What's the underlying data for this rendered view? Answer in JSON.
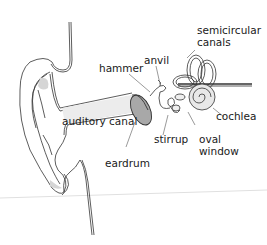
{
  "diagram": {
    "title": "",
    "labels": {
      "semicircular_canals": "semicircular\ncanals",
      "anvil": "anvil",
      "hammer": "hammer",
      "cochlea": "cochlea",
      "auditory_canal": "auditory canal",
      "stirrup": "stirrup",
      "oval_window": "oval\nwindow",
      "eardrum": "eardrum"
    },
    "colors": {
      "line": "#333333",
      "fill_gray": "#d9d9d9",
      "eardrum_fill": "#a8a8a8",
      "canal_fill": "#ececec"
    }
  }
}
